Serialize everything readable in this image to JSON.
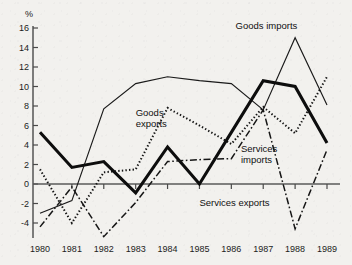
{
  "chart_data": {
    "type": "line",
    "title": "",
    "xlabel": "",
    "ylabel": "%",
    "y_unit_symbol": "%",
    "x": [
      1980,
      1981,
      1982,
      1983,
      1984,
      1985,
      1986,
      1987,
      1988,
      1989
    ],
    "categories": [
      "1980",
      "1981",
      "1982",
      "1983",
      "1984",
      "1985",
      "1986",
      "1987",
      "1988",
      "1989"
    ],
    "xlim": [
      1980,
      1989
    ],
    "ylim": [
      -4,
      16
    ],
    "y_ticks": [
      -4,
      -2,
      0,
      2,
      4,
      6,
      8,
      10,
      12,
      14,
      16
    ],
    "y_tick_labels": [
      "-4",
      "-2",
      "0",
      "2",
      "4",
      "6",
      "8",
      "10",
      "12",
      "14",
      "16"
    ],
    "x_ticks": [
      1980,
      1981,
      1982,
      1983,
      1984,
      1985,
      1986,
      1987,
      1988,
      1989
    ],
    "grid": false,
    "legend_position": "inline-annotations",
    "zero_line": true,
    "series": [
      {
        "name": "Goods imports",
        "style": "thin-solid",
        "label_x": 1987.1,
        "label_y": 15.9,
        "values": [
          -3.0,
          -1.7,
          7.7,
          10.3,
          11.0,
          10.6,
          10.3,
          7.6,
          15.0,
          8.1
        ]
      },
      {
        "name": "Goods exports",
        "style": "dotted",
        "label_x": 1983.0,
        "label_y": 7.0,
        "values": [
          1.5,
          -4.0,
          1.2,
          1.5,
          7.8,
          6.0,
          4.1,
          7.9,
          5.2,
          11.0
        ]
      },
      {
        "name": "Services imports",
        "style": "thick-solid",
        "label_x": 1986.3,
        "label_y": 3.3,
        "values": [
          5.3,
          1.7,
          2.3,
          -0.9,
          3.8,
          0.0,
          5.3,
          10.6,
          10.0,
          4.2
        ]
      },
      {
        "name": "Services exports",
        "style": "dash-dot",
        "label_x": 1986.1,
        "label_y": -2.3,
        "values": [
          -4.4,
          -0.3,
          -5.4,
          -1.9,
          2.3,
          2.5,
          2.6,
          7.6,
          -4.6,
          3.5
        ]
      }
    ]
  },
  "colors": {
    "background": "#f2f1ee",
    "ink": "#1a1a1a",
    "axis": "#4a4a4a"
  }
}
